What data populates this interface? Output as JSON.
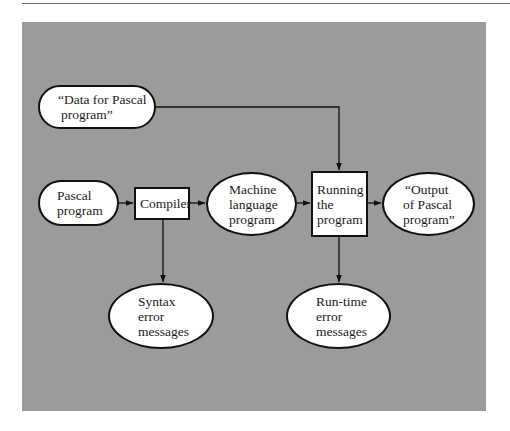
{
  "diagram": {
    "title": "",
    "background_color": "#9b9b9b",
    "node_fill": "#ffffff",
    "stroke_color": "#111111",
    "nodes": [
      {
        "id": "data",
        "shape": "pill",
        "lines": [
          "“Data for Pascal",
          "program”"
        ]
      },
      {
        "id": "pascal",
        "shape": "pill",
        "lines": [
          "Pascal",
          "program"
        ]
      },
      {
        "id": "compiler",
        "shape": "box",
        "lines": [
          "Compiler"
        ]
      },
      {
        "id": "machine",
        "shape": "oval",
        "lines": [
          "Machine",
          "language",
          "program"
        ]
      },
      {
        "id": "running",
        "shape": "box",
        "lines": [
          "Running",
          "the",
          "program"
        ]
      },
      {
        "id": "output",
        "shape": "oval",
        "lines": [
          "“Output",
          "of Pascal",
          "program”"
        ]
      },
      {
        "id": "syntax",
        "shape": "oval",
        "lines": [
          "Syntax",
          "error",
          "messages"
        ]
      },
      {
        "id": "runtime",
        "shape": "oval",
        "lines": [
          "Run-time",
          "error",
          "messages"
        ]
      }
    ],
    "edges": [
      {
        "from": "data",
        "to": "running"
      },
      {
        "from": "pascal",
        "to": "compiler"
      },
      {
        "from": "compiler",
        "to": "machine"
      },
      {
        "from": "machine",
        "to": "running"
      },
      {
        "from": "running",
        "to": "output"
      },
      {
        "from": "compiler",
        "to": "syntax"
      },
      {
        "from": "running",
        "to": "runtime"
      }
    ]
  }
}
